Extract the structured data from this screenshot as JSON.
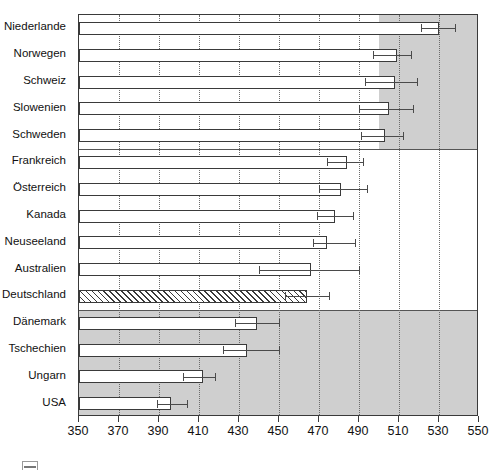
{
  "chart_data": {
    "type": "bar",
    "orientation": "horizontal",
    "title": "",
    "subtitle": "",
    "xlabel": "",
    "ylabel": "",
    "xlim": [
      350,
      550
    ],
    "xticks": [
      350,
      370,
      390,
      410,
      430,
      450,
      470,
      490,
      510,
      530,
      550
    ],
    "xtick_labels": [
      "350",
      "370",
      "390",
      "410",
      "430",
      "450",
      "470",
      "490",
      "510",
      "530",
      "550"
    ],
    "grid": "vertical dotted gridlines at every tick",
    "legend": "cropped at bottom-left edge",
    "categories": [
      "Niederlande",
      "Norwegen",
      "Schweiz",
      "Slowenien",
      "Schweden",
      "Frankreich",
      "Österreich",
      "Kanada",
      "Neuseeland",
      "Australien",
      "Deutschland",
      "Dänemark",
      "Tschechien",
      "Ungarn",
      "USA"
    ],
    "values": [
      530,
      509,
      508,
      505,
      503,
      484,
      481,
      478,
      474,
      466,
      464,
      439,
      434,
      412,
      396
    ],
    "err_low": [
      521,
      497,
      493,
      490,
      491,
      474,
      470,
      469,
      467,
      440,
      453,
      428,
      422,
      402,
      389
    ],
    "err_high": [
      538,
      516,
      519,
      517,
      512,
      492,
      494,
      487,
      488,
      490,
      475,
      450,
      450,
      418,
      404
    ],
    "group_bands": [
      {
        "name": "top-band",
        "rows": [
          0,
          4
        ],
        "shaded": true,
        "shade_from": 500,
        "shade_to": 550
      },
      {
        "name": "middle-band",
        "rows": [
          5,
          10
        ],
        "shaded": false
      },
      {
        "name": "bottom-band",
        "rows": [
          11,
          14
        ],
        "shaded": true,
        "shade_from": 350,
        "shade_to": 550
      }
    ],
    "highlighted_category": "Deutschland",
    "highlight_style": "diagonal-hatch",
    "bar_fill": "#ffffff",
    "bar_edge": "#3a3a3a",
    "band_shade_color": "#cfcfcf",
    "error_bar_color": "#4a4a4a",
    "grid_color": "#6b6b6b"
  },
  "axis": {
    "x_min_label": "350",
    "x_max_label": "550"
  }
}
